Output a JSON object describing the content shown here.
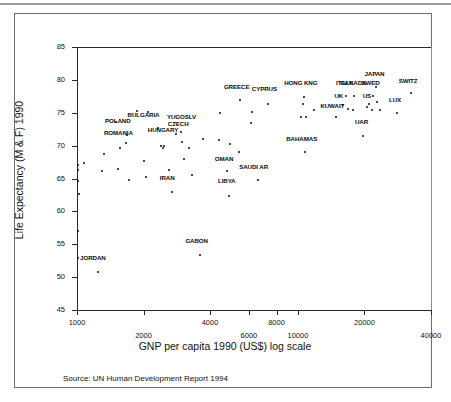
{
  "figure": {
    "ylabel": "Life Expectancy (M & F) 1990",
    "xlabel": "GNP per capita 1990 (US$)  log scale",
    "source": "Source: UN Human Development Report 1994"
  },
  "chart_data": {
    "type": "scatter",
    "title": "",
    "xlabel": "GNP per capita 1990 (US$)  log scale",
    "ylabel": "Life Expectancy (M & F) 1990",
    "xscale": "log",
    "yscale": "linear",
    "xlim": [
      1000,
      40000
    ],
    "ylim": [
      45,
      85
    ],
    "grid": false,
    "legend": null,
    "xticks": [
      1000,
      2000,
      4000,
      6000,
      8000,
      10000,
      20000,
      40000
    ],
    "xtick_labels": [
      "1000",
      "2000",
      "4000",
      "6000",
      "8000",
      "10000",
      "20000",
      "40000"
    ],
    "xtick_rows": [
      "hi",
      "lo",
      "hi",
      "lo",
      "hi",
      "lo",
      "hi",
      "lo"
    ],
    "yticks": [
      45,
      50,
      55,
      60,
      65,
      70,
      75,
      80,
      85
    ],
    "ytick_labels": [
      "45",
      "50",
      "55",
      "60",
      "65",
      "70",
      "75",
      "80",
      "85"
    ],
    "points": [
      {
        "label": "JORDAN",
        "x": 1250,
        "y": 50.8,
        "lx": 1180,
        "ly": 52.4
      },
      {
        "label": "",
        "x": 1010,
        "y": 52.9
      },
      {
        "label": "",
        "x": 1010,
        "y": 57.0
      },
      {
        "label": "",
        "x": 1020,
        "y": 62.7
      },
      {
        "label": "",
        "x": 1015,
        "y": 64.6
      },
      {
        "label": "",
        "x": 1010,
        "y": 66.3
      },
      {
        "label": "",
        "x": 1010,
        "y": 67.0
      },
      {
        "label": "",
        "x": 1080,
        "y": 67.3
      },
      {
        "label": "",
        "x": 1330,
        "y": 68.7
      },
      {
        "label": "",
        "x": 1300,
        "y": 66.1
      },
      {
        "label": "",
        "x": 1540,
        "y": 66.5
      },
      {
        "label": "",
        "x": 1570,
        "y": 69.7
      },
      {
        "label": "POLAND",
        "x": 1690,
        "y": 71.6,
        "lx": 1530,
        "ly": 73.3
      },
      {
        "label": "",
        "x": 1500,
        "y": 73.6
      },
      {
        "label": "ROMANIA",
        "x": 1660,
        "y": 70.4,
        "lx": 1540,
        "ly": 71.5
      },
      {
        "label": "",
        "x": 1720,
        "y": 64.8
      },
      {
        "label": "",
        "x": 1870,
        "y": 75.2
      },
      {
        "label": "BULGARIA",
        "x": 2100,
        "y": 75.1,
        "lx": 2000,
        "ly": 74.2
      },
      {
        "label": "",
        "x": 2020,
        "y": 67.6
      },
      {
        "label": "",
        "x": 2050,
        "y": 65.3
      },
      {
        "label": "",
        "x": 2330,
        "y": 72.7
      },
      {
        "label": "HUNGARY",
        "x": 2480,
        "y": 70.0,
        "lx": 2450,
        "ly": 71.9
      },
      {
        "label": "",
        "x": 2400,
        "y": 69.9
      },
      {
        "label": "",
        "x": 2450,
        "y": 69.7
      },
      {
        "label": "CZECH",
        "x": 2800,
        "y": 71.8,
        "lx": 2870,
        "ly": 72.9
      },
      {
        "label": "YUGOSLV",
        "x": 2950,
        "y": 72.1,
        "lx": 2970,
        "ly": 73.9
      },
      {
        "label": "",
        "x": 2620,
        "y": 66.3
      },
      {
        "label": "IRAN",
        "x": 2680,
        "y": 63.0,
        "lx": 2560,
        "ly": 64.6
      },
      {
        "label": "",
        "x": 2990,
        "y": 70.6
      },
      {
        "label": "",
        "x": 3050,
        "y": 68.0
      },
      {
        "label": "",
        "x": 3220,
        "y": 69.6
      },
      {
        "label": "",
        "x": 3330,
        "y": 65.5
      },
      {
        "label": "GABON",
        "x": 3620,
        "y": 53.4,
        "lx": 3480,
        "ly": 55.0
      },
      {
        "label": "",
        "x": 3700,
        "y": 71.0
      },
      {
        "label": "",
        "x": 4400,
        "y": 70.8
      },
      {
        "label": "",
        "x": 4450,
        "y": 74.9
      },
      {
        "label": "OMAN",
        "x": 4780,
        "y": 66.1,
        "lx": 4630,
        "ly": 67.5
      },
      {
        "label": "LIBYA",
        "x": 4880,
        "y": 62.4,
        "lx": 4760,
        "ly": 64.1
      },
      {
        "label": "",
        "x": 4900,
        "y": 70.2
      },
      {
        "label": "GREECE",
        "x": 5450,
        "y": 77.0,
        "lx": 5280,
        "ly": 78.5
      },
      {
        "label": "",
        "x": 5400,
        "y": 69.1
      },
      {
        "label": "",
        "x": 6100,
        "y": 73.4
      },
      {
        "label": "SAUDI AR",
        "x": 6600,
        "y": 64.7,
        "lx": 6300,
        "ly": 66.3
      },
      {
        "label": "",
        "x": 6200,
        "y": 75.1
      },
      {
        "label": "CYPRUS",
        "x": 7300,
        "y": 76.4,
        "lx": 7050,
        "ly": 78.1
      },
      {
        "label": "BAHAMAS",
        "x": 10800,
        "y": 69.0,
        "lx": 10400,
        "ly": 70.5
      },
      {
        "label": "HONG KNG",
        "x": 10700,
        "y": 77.4,
        "lx": 10300,
        "ly": 79.0
      },
      {
        "label": "",
        "x": 10500,
        "y": 76.3
      },
      {
        "label": "",
        "x": 10300,
        "y": 74.4
      },
      {
        "label": "",
        "x": 10900,
        "y": 74.4
      },
      {
        "label": "",
        "x": 11800,
        "y": 75.4
      },
      {
        "label": "KUWAIT",
        "x": 14900,
        "y": 74.3,
        "lx": 14300,
        "ly": 75.6
      },
      {
        "label": "UK",
        "x": 16000,
        "y": 76.2,
        "lx": 15300,
        "ly": 77.1
      },
      {
        "label": "ITALY",
        "x": 16500,
        "y": 77.5,
        "lx": 16200,
        "ly": 79.0
      },
      {
        "label": "CANADA",
        "x": 18000,
        "y": 77.6,
        "lx": 17800,
        "ly": 79.0
      },
      {
        "label": "",
        "x": 16900,
        "y": 75.5
      },
      {
        "label": "",
        "x": 17800,
        "y": 75.4
      },
      {
        "label": "UAR",
        "x": 19700,
        "y": 71.4,
        "lx": 19400,
        "ly": 73.2
      },
      {
        "label": "US",
        "x": 20600,
        "y": 75.9,
        "lx": 20500,
        "ly": 77.1
      },
      {
        "label": "SWED",
        "x": 21800,
        "y": 77.6,
        "lx": 21300,
        "ly": 79.0
      },
      {
        "label": "JAPAN",
        "x": 22500,
        "y": 78.9,
        "lx": 22200,
        "ly": 80.4
      },
      {
        "label": "",
        "x": 21000,
        "y": 76.4
      },
      {
        "label": "",
        "x": 21700,
        "y": 75.4
      },
      {
        "label": "",
        "x": 22800,
        "y": 76.6
      },
      {
        "label": "",
        "x": 23600,
        "y": 75.4
      },
      {
        "label": "LUX",
        "x": 28000,
        "y": 75.0,
        "lx": 27500,
        "ly": 76.5
      },
      {
        "label": "SWITZ",
        "x": 32500,
        "y": 78.0,
        "lx": 31500,
        "ly": 79.4
      }
    ]
  }
}
